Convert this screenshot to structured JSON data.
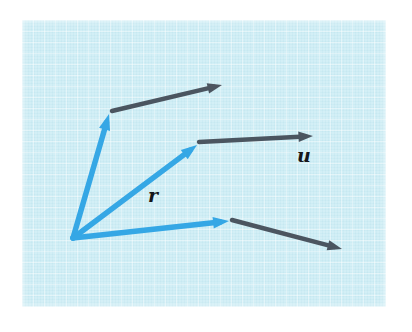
{
  "figure": {
    "kind": "vector-addition-diagram",
    "caption": "",
    "canvas": {
      "width": 412,
      "height": 332,
      "background": "#ffffff"
    },
    "panel": {
      "x": 22,
      "y": 20,
      "width": 364,
      "height": 287,
      "fill": "#d3eff6",
      "texture": "faint-square-grid"
    },
    "colors": {
      "blue_vector": "#35a7e5",
      "dark_vector": "#4b5560",
      "panel_background": "#d3eff6",
      "label_text": "#16171b",
      "page_background": "#ffffff"
    },
    "origin": {
      "x": 73,
      "y": 238
    },
    "labels": [
      {
        "id": "u",
        "text": "u",
        "x": 297,
        "y": 146,
        "style": "bold-italic-serif"
      },
      {
        "id": "r",
        "text": "r",
        "x": 148,
        "y": 186,
        "style": "bold-italic-serif"
      }
    ],
    "vectors": [
      {
        "id": "blue-upper",
        "name": "blue-vector-upper-left",
        "color": "#35a7e5",
        "width": 5.5,
        "from": {
          "x": 73,
          "y": 238
        },
        "to": {
          "x": 109,
          "y": 114
        },
        "arrowhead": true,
        "head_size": 11
      },
      {
        "id": "blue-middle",
        "name": "blue-vector-r",
        "color": "#35a7e5",
        "width": 5.5,
        "from": {
          "x": 73,
          "y": 238
        },
        "to": {
          "x": 197,
          "y": 145
        },
        "arrowhead": true,
        "head_size": 11,
        "label": "r"
      },
      {
        "id": "blue-lower",
        "name": "blue-vector-lower-right",
        "color": "#35a7e5",
        "width": 5.5,
        "from": {
          "x": 73,
          "y": 238
        },
        "to": {
          "x": 229,
          "y": 221
        },
        "arrowhead": true,
        "head_size": 11
      },
      {
        "id": "dark-upper",
        "name": "dark-vector-upper",
        "color": "#4b5560",
        "width": 4.5,
        "from": {
          "x": 112,
          "y": 111
        },
        "to": {
          "x": 222,
          "y": 85
        },
        "arrowhead": true,
        "head_size": 10
      },
      {
        "id": "dark-middle",
        "name": "dark-vector-u",
        "color": "#4b5560",
        "width": 4.5,
        "from": {
          "x": 199,
          "y": 142
        },
        "to": {
          "x": 313,
          "y": 136
        },
        "arrowhead": true,
        "head_size": 10,
        "label": "u"
      },
      {
        "id": "dark-lower",
        "name": "dark-vector-lower",
        "color": "#4b5560",
        "width": 4.5,
        "from": {
          "x": 232,
          "y": 220
        },
        "to": {
          "x": 342,
          "y": 249
        },
        "arrowhead": true,
        "head_size": 10
      }
    ]
  }
}
